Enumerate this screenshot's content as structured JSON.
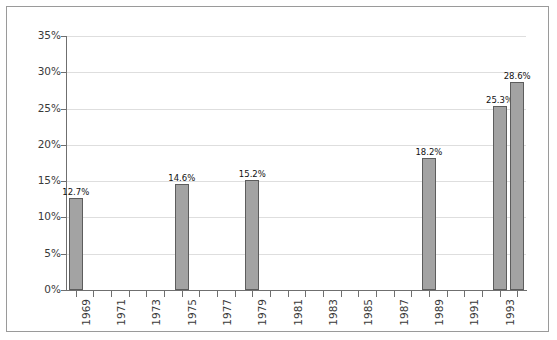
{
  "chart_data": {
    "type": "bar",
    "title": "",
    "subtitle": "",
    "xlabel": "",
    "ylabel": "",
    "categories": [
      "1969",
      "1970",
      "1971",
      "1972",
      "1973",
      "1974",
      "1975",
      "1976",
      "1977",
      "1978",
      "1979",
      "1980",
      "1981",
      "1982",
      "1983",
      "1984",
      "1985",
      "1986",
      "1987",
      "1988",
      "1989",
      "1990",
      "1991",
      "1992",
      "1993",
      "1994"
    ],
    "tick_labels": [
      "1969",
      "",
      "1971",
      "",
      "1973",
      "",
      "1975",
      "",
      "1977",
      "",
      "1979",
      "",
      "1981",
      "",
      "1983",
      "",
      "1985",
      "",
      "1987",
      "",
      "1989",
      "",
      "1991",
      "",
      "1993",
      ""
    ],
    "values": [
      12.7,
      null,
      null,
      null,
      null,
      null,
      14.6,
      null,
      null,
      null,
      15.2,
      null,
      null,
      null,
      null,
      null,
      null,
      null,
      null,
      null,
      18.2,
      null,
      null,
      null,
      25.3,
      28.6
    ],
    "data_labels": [
      "12.7%",
      "",
      "",
      "",
      "",
      "",
      "14.6%",
      "",
      "",
      "",
      "15.2%",
      "",
      "",
      "",
      "",
      "",
      "",
      "",
      "",
      "",
      "18.2%",
      "",
      "",
      "",
      "25.3%",
      "28.6%"
    ],
    "ylim": [
      0,
      35
    ],
    "ytick_values": [
      0,
      5,
      10,
      15,
      20,
      25,
      30,
      35
    ],
    "ytick_labels": [
      "0%",
      "5%",
      "10%",
      "15%",
      "20%",
      "25%",
      "30%",
      "35%"
    ],
    "grid": true,
    "legend": false,
    "legend_position": "none",
    "colors": {
      "bar_fill": "#a3a3a3",
      "bar_stroke": "#5d5d5d",
      "gridline": "#dedede",
      "axis": "#6f6f6f",
      "text": "#3a3a3a",
      "frame": "#9a9a9a",
      "background": "#ffffff"
    }
  }
}
